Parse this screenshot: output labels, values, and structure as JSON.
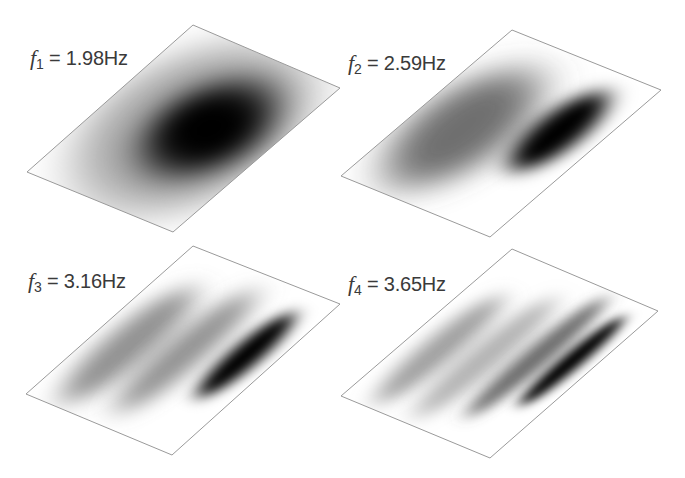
{
  "figure": {
    "panels": [
      {
        "id": "mode-1",
        "symbol": "f",
        "subscript": "1",
        "equals": "=",
        "value": "1.98Hz",
        "frequency_hz": 1.98,
        "corners": [
          [
            193,
            25
          ],
          [
            340,
            88
          ],
          [
            173,
            232
          ],
          [
            27,
            172
          ]
        ],
        "label_pos": [
          30,
          47
        ],
        "blobs": [
          {
            "cx": 0.62,
            "cy": 0.55,
            "rx": 0.3,
            "ry": 0.28,
            "shade": "#000000",
            "opacity": 1.0,
            "blur": 16
          }
        ],
        "halo": {
          "cx": 0.55,
          "cy": 0.52,
          "rx": 0.55,
          "ry": 0.52,
          "shade": "#000000",
          "opacity": 0.35,
          "blur": 22
        }
      },
      {
        "id": "mode-2",
        "symbol": "f",
        "subscript": "2",
        "equals": "=",
        "value": "2.59Hz",
        "frequency_hz": 2.59,
        "corners": [
          [
            512,
            30
          ],
          [
            661,
            90
          ],
          [
            490,
            237
          ],
          [
            341,
            176
          ]
        ],
        "label_pos": [
          348,
          52
        ],
        "blobs": [
          {
            "cx": 0.3,
            "cy": 0.45,
            "rx": 0.28,
            "ry": 0.38,
            "shade": "#555555",
            "opacity": 0.85,
            "blur": 18
          },
          {
            "cx": 0.75,
            "cy": 0.62,
            "rx": 0.14,
            "ry": 0.26,
            "shade": "#000000",
            "opacity": 1.0,
            "blur": 10
          }
        ]
      },
      {
        "id": "mode-3",
        "symbol": "f",
        "subscript": "3",
        "equals": "=",
        "value": "3.16Hz",
        "frequency_hz": 3.16,
        "corners": [
          [
            193,
            246
          ],
          [
            340,
            304
          ],
          [
            172,
            455
          ],
          [
            26,
            394
          ]
        ],
        "label_pos": [
          28,
          270
        ],
        "blobs": [
          {
            "cx": 0.22,
            "cy": 0.42,
            "rx": 0.14,
            "ry": 0.38,
            "shade": "#777777",
            "opacity": 0.8,
            "blur": 12
          },
          {
            "cx": 0.52,
            "cy": 0.5,
            "rx": 0.12,
            "ry": 0.4,
            "shade": "#777777",
            "opacity": 0.8,
            "blur": 12
          },
          {
            "cx": 0.82,
            "cy": 0.6,
            "rx": 0.09,
            "ry": 0.28,
            "shade": "#000000",
            "opacity": 1.0,
            "blur": 8
          }
        ]
      },
      {
        "id": "mode-4",
        "symbol": "f",
        "subscript": "4",
        "equals": "=",
        "value": "3.65Hz",
        "frequency_hz": 3.65,
        "corners": [
          [
            512,
            249
          ],
          [
            658,
            311
          ],
          [
            490,
            458
          ],
          [
            341,
            396
          ]
        ],
        "label_pos": [
          348,
          273
        ],
        "blobs": [
          {
            "cx": 0.2,
            "cy": 0.4,
            "rx": 0.1,
            "ry": 0.36,
            "shade": "#888888",
            "opacity": 0.8,
            "blur": 10
          },
          {
            "cx": 0.45,
            "cy": 0.45,
            "rx": 0.1,
            "ry": 0.4,
            "shade": "#999999",
            "opacity": 0.75,
            "blur": 10
          },
          {
            "cx": 0.68,
            "cy": 0.55,
            "rx": 0.08,
            "ry": 0.4,
            "shade": "#555555",
            "opacity": 0.85,
            "blur": 8
          },
          {
            "cx": 0.86,
            "cy": 0.6,
            "rx": 0.06,
            "ry": 0.3,
            "shade": "#000000",
            "opacity": 1.0,
            "blur": 6
          }
        ]
      }
    ],
    "colors": {
      "background": "#ffffff",
      "outline": "#9a9a9a",
      "label_text": "#3a3a3a"
    }
  }
}
